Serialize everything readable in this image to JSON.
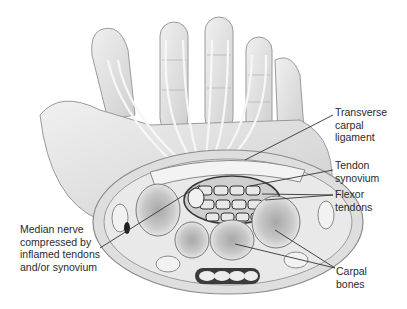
{
  "diagram": {
    "labels": {
      "transverse_ligament": "Transverse\ncarpal\nligament",
      "tendon_synovium": "Tendon\nsynovium",
      "flexor_tendons": "Flexor\ntendons",
      "median_nerve": "Median nerve\ncompressed by\ninflamed tendons\nand/or synovium",
      "carpal_bones": "Carpal\nbones"
    },
    "colors": {
      "background": "#ffffff",
      "skin": "#e4e4e4",
      "outline": "#8a8a8a",
      "bone": "#f2f2f2",
      "bone_marrow": "#9a9a9a",
      "dark": "#3a3a3a",
      "text": "#2a2a2a"
    }
  }
}
